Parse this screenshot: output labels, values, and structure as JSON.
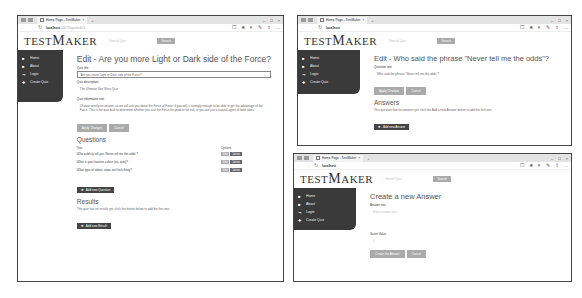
{
  "browser": {
    "tab_title": "Home Page - TestMaker",
    "tab_close": "×",
    "new_tab": "+",
    "url_host": "localhost",
    "url_path": ":40079/quiz/edit/1",
    "controls": [
      "–",
      "□",
      "×"
    ],
    "nav": [
      "←",
      "→",
      "↻"
    ],
    "toolbar_icons": [
      "☐",
      "★",
      "≡",
      "✎",
      "⇧",
      "…"
    ]
  },
  "app": {
    "logo_prefix": "TEST",
    "logo_big": "M",
    "logo_suffix": "AKER",
    "search_placeholder": "Search Quiz",
    "search_button": "Search"
  },
  "sidebar": {
    "items": [
      {
        "icon": "home-icon",
        "glyph": "■",
        "label": "Home"
      },
      {
        "icon": "info-icon",
        "glyph": "■",
        "label": "About"
      },
      {
        "icon": "login-icon",
        "glyph": "⇥",
        "label": "Login"
      },
      {
        "icon": "plus-icon",
        "glyph": "✚",
        "label": "Create Quiz"
      }
    ]
  },
  "window_left": {
    "title": "Edit - Are you more Light or Dark side of the Force?",
    "quiz_title_label": "Quiz title",
    "quiz_title_value": "Are you more Light or Dark side of the Force?",
    "quiz_desc_label": "Quiz description",
    "quiz_desc_value": "The Ultimate Star Wars Quiz",
    "quiz_text_label": "Quiz informative text",
    "quiz_text_value": "Choose wisely an answer, as we will ask you about the Force of Force: if you will, it strongly enough to be able to get the advantage of the Force. This is the quiz built to determine whether you use the Force for good or for evil, or you are just a natural agent of both sides.",
    "apply_button": "Apply Changes",
    "cancel_button": "Cancel",
    "questions_heading": "Questions",
    "questions_table": {
      "headers": [
        "Text",
        "Options"
      ],
      "rows": [
        {
          "text": "Who publicly tell you 'Never tell me the odds'?",
          "edit": "Edit",
          "delete": "Delete"
        },
        {
          "text": "What is your favorite colour (no, wait)?",
          "edit": "Edit",
          "delete": "Delete"
        },
        {
          "text": "What type of robots stops ion/ lock thing?",
          "edit": "Edit",
          "delete": "Delete"
        }
      ]
    },
    "add_question_button": "Add new Question",
    "results_heading": "Results",
    "results_note": "This quiz has no results yet: click the button below to add the first one.",
    "add_result_button": "Add new Result"
  },
  "window_top_right": {
    "title": "Edit - Who said the phrase \"Never tell me the odds\"?",
    "question_text_label": "Question text",
    "question_text_value": "Who said the phrase \"Never tell me the odds\"?",
    "apply_button": "Apply Changes",
    "cancel_button": "Cancel",
    "answers_heading": "Answers",
    "answers_note": "This question has no answers yet: click the Add a new Answer button to add the first one.",
    "add_answer_button": "Add new Answer"
  },
  "window_bottom_right": {
    "title": "Create a new Answer",
    "answer_text_label": "Answer text",
    "answer_text_placeholder": "Enter answer text...",
    "score_label": "Score Value",
    "score_placeholder": "0",
    "create_button": "Create the Answer",
    "cancel_button": "Cancel"
  }
}
